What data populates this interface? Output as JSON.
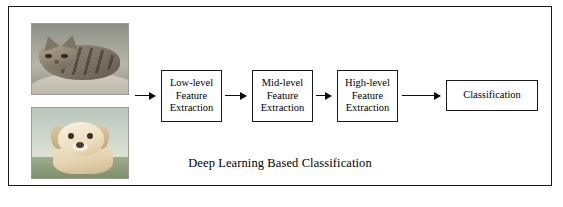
{
  "figure": {
    "caption": "Deep Learning Based Classification",
    "border_color": "#1a1a1a",
    "background_color": "#ffffff"
  },
  "inputs": [
    {
      "name": "cat-image",
      "alt": "photograph of a tabby cat lying down"
    },
    {
      "name": "dog-image",
      "alt": "photograph of a cream colored puppy on grass"
    }
  ],
  "pipeline": {
    "boxes": [
      {
        "id": "low",
        "label": "Low-level\nFeature\nExtraction"
      },
      {
        "id": "mid",
        "label": "Mid-level\nFeature\nExtraction"
      },
      {
        "id": "high",
        "label": "High-level\nFeature\nExtraction"
      },
      {
        "id": "class",
        "label": "Classification"
      }
    ],
    "arrow_count": 4,
    "arrow_color": "#0d0d0d"
  }
}
